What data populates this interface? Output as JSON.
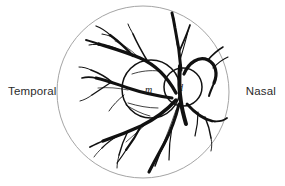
{
  "figure": {
    "name": "fundus-diagram",
    "background_color": "#ffffff",
    "outline_color": "#9a9a9a",
    "vessel_color": "#111111",
    "text_color": "#2b2b2b"
  },
  "labels": {
    "temporal": "Temporal",
    "nasal": "Nasal"
  },
  "regions": {
    "macula_letter": "m",
    "disc_letter": "d"
  },
  "geometry": {
    "fundus_circle": {
      "cx": 143,
      "cy": 92,
      "r": 86
    },
    "macula_circle": {
      "cx": 151,
      "cy": 89,
      "r": 29
    },
    "disc_circle": {
      "cx": 183,
      "cy": 87,
      "r": 19
    }
  }
}
